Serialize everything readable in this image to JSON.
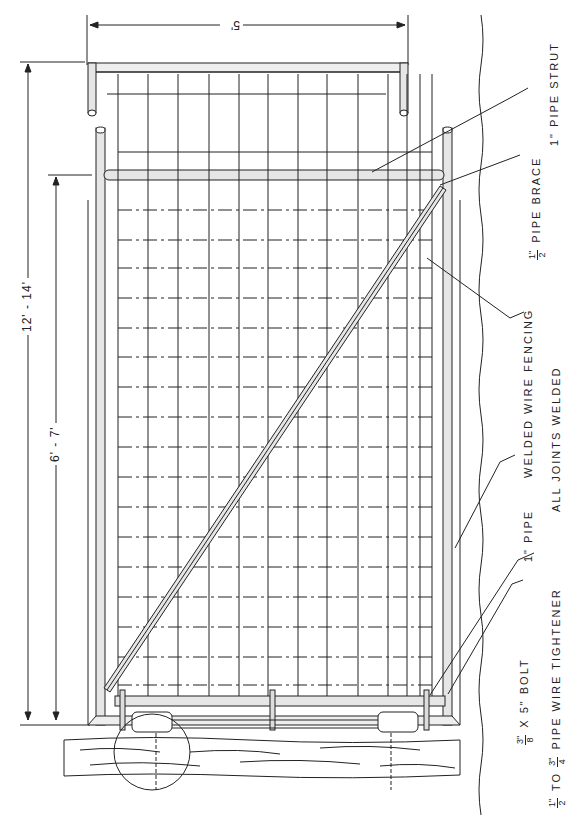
{
  "drawing": {
    "title": "Pipe frame gate with welded wire fencing",
    "dimensions": {
      "width": "5'",
      "overall_height": "12' - 14'",
      "strut_height": "6' - 7'"
    },
    "labels": {
      "pipe_strut": "1\" PIPE STRUT",
      "pipe_brace_frac_num": "1\"",
      "pipe_brace_frac_den": "2",
      "pipe_brace": "PIPE BRACE",
      "welded_wire_fencing": "WELDED WIRE FENCING",
      "all_joints_welded": "ALL JOINTS WELDED",
      "pipe": "1\" PIPE",
      "bolt_frac_num": "3\"",
      "bolt_frac_den": "8",
      "bolt": "X 5\" BOLT",
      "tightener_frac1_num": "1\"",
      "tightener_frac1_den": "2",
      "tightener_to": "TO",
      "tightener_frac2_num": "3\"",
      "tightener_frac2_den": "4",
      "tightener": "PIPE WIRE TIGHTENER"
    },
    "colors": {
      "ink": "#222222",
      "paper": "#ffffff",
      "pipe_fill": "#e6e6e6"
    }
  }
}
